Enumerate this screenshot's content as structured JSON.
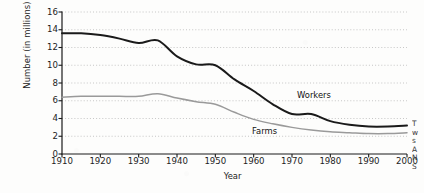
{
  "chart_data": {
    "type": "line",
    "title": "",
    "xlabel": "Year",
    "ylabel": "Number (in millions)",
    "xlim": [
      1910,
      2000
    ],
    "ylim": [
      0,
      16
    ],
    "xticks": [
      1910,
      1920,
      1930,
      1940,
      1950,
      1960,
      1970,
      1980,
      1990,
      2000
    ],
    "yticks": [
      0,
      2,
      4,
      6,
      8,
      10,
      12,
      14,
      16
    ],
    "grid": "horizontal-dotted",
    "legend_position": "inline-annotations",
    "x": [
      1910,
      1915,
      1920,
      1925,
      1930,
      1935,
      1940,
      1945,
      1950,
      1955,
      1960,
      1965,
      1970,
      1975,
      1980,
      1985,
      1990,
      1995,
      2000
    ],
    "series": [
      {
        "name": "Workers",
        "color": "#1a1a1a",
        "values": [
          13.6,
          13.6,
          13.4,
          13.0,
          12.5,
          12.8,
          11.0,
          10.1,
          10.0,
          8.4,
          7.1,
          5.6,
          4.5,
          4.5,
          3.7,
          3.3,
          3.1,
          3.1,
          3.2
        ]
      },
      {
        "name": "Farms",
        "color": "#9a9a9a",
        "values": [
          6.4,
          6.5,
          6.5,
          6.5,
          6.5,
          6.8,
          6.3,
          5.9,
          5.6,
          4.7,
          3.9,
          3.4,
          3.0,
          2.7,
          2.5,
          2.4,
          2.3,
          2.3,
          2.4
        ]
      }
    ],
    "annotations": [
      {
        "text": "Workers",
        "series": "Workers"
      },
      {
        "text": "Farms",
        "series": "Farms"
      }
    ]
  },
  "axis": {
    "x_title": "Year",
    "y_title": "Number (in millions)"
  },
  "margin_note": {
    "lines": [
      "T",
      "w",
      "s",
      "A",
      "N",
      "S"
    ]
  }
}
